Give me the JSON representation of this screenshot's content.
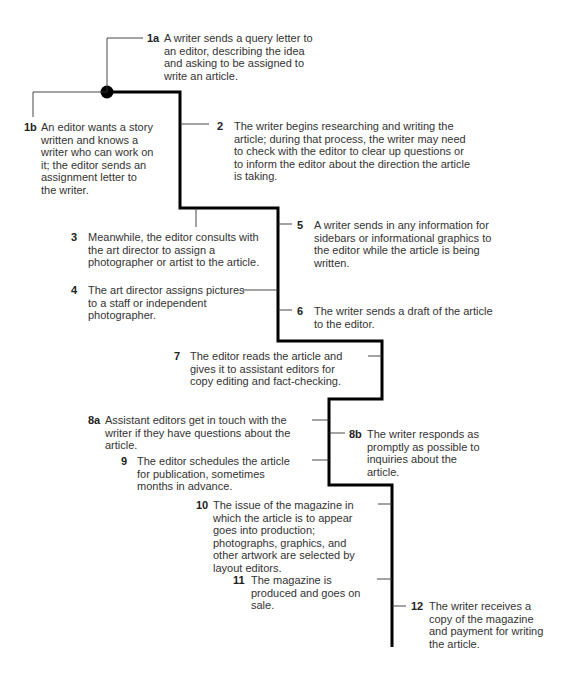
{
  "diagram": {
    "type": "process-flow",
    "line_color": "#000000",
    "steps": [
      {
        "id": "1a",
        "text": "A writer sends a query letter to an editor, describing the idea and asking to be assigned to write an article."
      },
      {
        "id": "1b",
        "text": "An editor wants a story written and knows a writer who can work on it; the editor sends an assignment letter to the writer."
      },
      {
        "id": "2",
        "text": "The writer begins researching and writing the article; during that process, the writer may need to check with the editor to clear up questions or to inform the editor about the direction the article is taking."
      },
      {
        "id": "3",
        "text": "Meanwhile, the editor consults with the art director to assign a photographer or artist to the article."
      },
      {
        "id": "4",
        "text": "The art director assigns pictures to a staff or independent photographer."
      },
      {
        "id": "5",
        "text": "A writer sends in any information for sidebars or informational graphics to the editor while the article is being written."
      },
      {
        "id": "6",
        "text": "The writer sends a draft of the article to the editor."
      },
      {
        "id": "7",
        "text": "The editor reads the article and gives it to assistant editors for copy editing and fact-checking."
      },
      {
        "id": "8a",
        "text": "Assistant editors get in touch with the writer if they have questions about the article."
      },
      {
        "id": "8b",
        "text": "The writer responds as promptly as possible to inquiries about the article."
      },
      {
        "id": "9",
        "text": "The editor schedules the article for publication, sometimes months in advance."
      },
      {
        "id": "10",
        "text": "The issue of the magazine in which the article is to appear goes into production; photographs, graphics, and other artwork are selected by layout editors."
      },
      {
        "id": "11",
        "text": "The magazine is produced and goes on sale."
      },
      {
        "id": "12",
        "text": "The writer receives a copy of the magazine and payment for writing the article."
      }
    ]
  }
}
